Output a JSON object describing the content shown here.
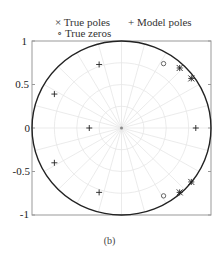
{
  "legend": {
    "true_poles": "× True poles",
    "model_poles": "+ Model poles",
    "true_zeros": "∘ True zeros"
  },
  "caption": "(b)",
  "chart_data": {
    "type": "scatter",
    "title": "",
    "xlabel": "",
    "ylabel": "",
    "xlim": [
      -1,
      1
    ],
    "ylim": [
      -1,
      1
    ],
    "yticks": [
      "1",
      "0.5",
      "0",
      "-0.5",
      "-1"
    ],
    "grid": "polar (light gray radial lines and circles)",
    "unit_circle": true,
    "legend_position": "top",
    "series": [
      {
        "name": "True poles",
        "marker": "x",
        "points": [
          [
            0.65,
            0.69
          ],
          [
            0.78,
            0.57
          ],
          [
            0.65,
            -0.74
          ],
          [
            0.78,
            -0.62
          ]
        ]
      },
      {
        "name": "Model poles",
        "marker": "+",
        "points": [
          [
            -0.25,
            0.73
          ],
          [
            -0.75,
            0.39
          ],
          [
            -0.36,
            0.0
          ],
          [
            0.83,
            0.0
          ],
          [
            -0.75,
            -0.4
          ],
          [
            -0.25,
            -0.74
          ],
          [
            0.65,
            0.69
          ],
          [
            0.78,
            0.57
          ],
          [
            0.65,
            -0.74
          ],
          [
            0.78,
            -0.62
          ]
        ]
      },
      {
        "name": "True zeros",
        "marker": "o",
        "points": [
          [
            0.47,
            0.74
          ],
          [
            0.47,
            -0.78
          ]
        ]
      }
    ]
  }
}
